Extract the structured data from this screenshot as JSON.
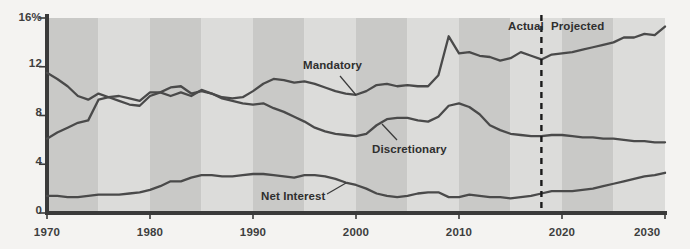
{
  "chart_data": {
    "type": "line",
    "title": "",
    "xlabel": "",
    "ylabel": "",
    "xlim": [
      1970,
      2030
    ],
    "ylim": [
      0,
      16
    ],
    "yticks": [
      0,
      4,
      8,
      12,
      16
    ],
    "ytick_labels": [
      "0",
      "4",
      "8",
      "12",
      "16%"
    ],
    "xticks": [
      1970,
      1980,
      1990,
      2000,
      2010,
      2020,
      2030
    ],
    "xtick_labels": [
      "1970",
      "1980",
      "1990",
      "2000",
      "2010",
      "2020",
      "2030"
    ],
    "grid": false,
    "legend_position": "inline-annotations",
    "background_bands": {
      "description": "alternating vertical shading every 5 years",
      "dark_color": "#c9c9c7",
      "light_color": "#dcdcda",
      "band_years": 5
    },
    "line_color": "#4a4a4a",
    "divider": {
      "x": 2018,
      "style": "dashed",
      "color": "#1a1a1a",
      "left_label": "Actual",
      "right_label": "Projected"
    },
    "annotations": [
      {
        "text": "Mandatory",
        "x": 1996,
        "y": 12.4,
        "series": "Mandatory"
      },
      {
        "text": "Discretionary",
        "x": 2001,
        "y": 5.1,
        "series": "Discretionary"
      },
      {
        "text": "Net Interest",
        "x": 1990,
        "y": 1.3,
        "series": "Net Interest"
      }
    ],
    "x": [
      1970,
      1971,
      1972,
      1973,
      1974,
      1975,
      1976,
      1977,
      1978,
      1979,
      1980,
      1981,
      1982,
      1983,
      1984,
      1985,
      1986,
      1987,
      1988,
      1989,
      1990,
      1991,
      1992,
      1993,
      1994,
      1995,
      1996,
      1997,
      1998,
      1999,
      2000,
      2001,
      2002,
      2003,
      2004,
      2005,
      2006,
      2007,
      2008,
      2009,
      2010,
      2011,
      2012,
      2013,
      2014,
      2015,
      2016,
      2017,
      2018,
      2019,
      2020,
      2021,
      2022,
      2023,
      2024,
      2025,
      2026,
      2027,
      2028,
      2029,
      2030
    ],
    "series": [
      {
        "name": "Mandatory",
        "values": [
          6.1,
          6.6,
          7.0,
          7.4,
          7.6,
          9.3,
          9.5,
          9.2,
          8.9,
          8.8,
          9.6,
          9.9,
          10.3,
          10.4,
          9.8,
          10.0,
          9.8,
          9.5,
          9.4,
          9.5,
          10.0,
          10.6,
          11.0,
          10.9,
          10.7,
          10.8,
          10.6,
          10.3,
          10.0,
          9.8,
          9.7,
          10.0,
          10.5,
          10.6,
          10.4,
          10.5,
          10.4,
          10.4,
          11.3,
          14.5,
          13.1,
          13.2,
          12.9,
          12.8,
          12.5,
          12.7,
          13.2,
          12.9,
          12.6,
          13.0,
          13.1,
          13.2,
          13.4,
          13.6,
          13.8,
          14.0,
          14.4,
          14.4,
          14.7,
          14.6,
          15.3
        ]
      },
      {
        "name": "Discretionary",
        "values": [
          11.5,
          11.0,
          10.4,
          9.6,
          9.3,
          9.8,
          9.5,
          9.6,
          9.4,
          9.2,
          9.9,
          9.9,
          9.6,
          9.9,
          9.6,
          10.1,
          9.8,
          9.4,
          9.2,
          9.0,
          8.9,
          9.0,
          8.6,
          8.3,
          7.9,
          7.5,
          7.0,
          6.7,
          6.5,
          6.4,
          6.3,
          6.5,
          7.2,
          7.7,
          7.8,
          7.8,
          7.6,
          7.5,
          7.9,
          8.8,
          9.0,
          8.7,
          8.1,
          7.2,
          6.8,
          6.5,
          6.4,
          6.3,
          6.3,
          6.4,
          6.4,
          6.3,
          6.2,
          6.2,
          6.1,
          6.1,
          6.0,
          5.9,
          5.9,
          5.8,
          5.8
        ]
      },
      {
        "name": "Net Interest",
        "values": [
          1.4,
          1.4,
          1.3,
          1.3,
          1.4,
          1.5,
          1.5,
          1.5,
          1.6,
          1.7,
          1.9,
          2.2,
          2.6,
          2.6,
          2.9,
          3.1,
          3.1,
          3.0,
          3.0,
          3.1,
          3.2,
          3.2,
          3.1,
          3.0,
          2.9,
          3.1,
          3.1,
          3.0,
          2.8,
          2.5,
          2.3,
          2.0,
          1.6,
          1.4,
          1.3,
          1.4,
          1.6,
          1.7,
          1.7,
          1.3,
          1.3,
          1.5,
          1.4,
          1.3,
          1.3,
          1.2,
          1.3,
          1.4,
          1.6,
          1.8,
          1.8,
          1.8,
          1.9,
          2.0,
          2.2,
          2.4,
          2.6,
          2.8,
          3.0,
          3.1,
          3.3
        ]
      }
    ]
  }
}
